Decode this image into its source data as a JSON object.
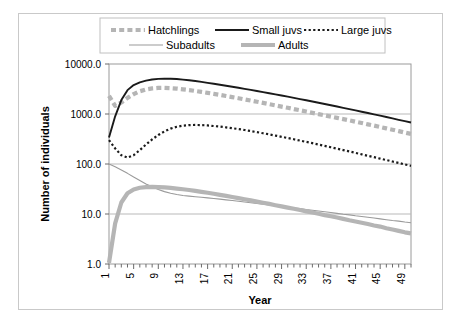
{
  "chart_data": {
    "type": "line",
    "title": "",
    "xlabel": "Year",
    "ylabel": "Number of individuals",
    "yscale": "log",
    "ylim": [
      1.0,
      10000.0
    ],
    "ytick_labels": [
      "1.0",
      "10.0",
      "100.0",
      "1000.0",
      "10000.0"
    ],
    "ytick_values": [
      1,
      10,
      100,
      1000,
      10000
    ],
    "xlim": [
      1,
      50
    ],
    "xtick_labels": [
      "1",
      "5",
      "9",
      "13",
      "17",
      "21",
      "25",
      "29",
      "33",
      "37",
      "41",
      "45",
      "49"
    ],
    "xtick_values": [
      1,
      5,
      9,
      13,
      17,
      21,
      25,
      29,
      33,
      37,
      41,
      45,
      49
    ],
    "grid": true,
    "legend_position": "top",
    "x": [
      1,
      2,
      3,
      4,
      5,
      6,
      7,
      8,
      9,
      10,
      11,
      12,
      13,
      14,
      15,
      16,
      17,
      18,
      19,
      20,
      21,
      22,
      23,
      24,
      25,
      26,
      27,
      28,
      29,
      30,
      31,
      32,
      33,
      34,
      35,
      36,
      37,
      38,
      39,
      40,
      41,
      42,
      43,
      44,
      45,
      46,
      47,
      48,
      49,
      50
    ],
    "series": [
      {
        "name": "Hatchlings",
        "color": "#b5b5b5",
        "style": "dashed",
        "width": 4.2,
        "values": [
          2300,
          1450,
          1700,
          2100,
          2500,
          2850,
          3100,
          3250,
          3320,
          3330,
          3290,
          3220,
          3120,
          3010,
          2890,
          2770,
          2650,
          2530,
          2410,
          2290,
          2180,
          2070,
          1960,
          1860,
          1760,
          1665,
          1575,
          1490,
          1405,
          1330,
          1255,
          1185,
          1120,
          1055,
          995,
          940,
          885,
          835,
          790,
          745,
          700,
          660,
          620,
          585,
          550,
          515,
          485,
          455,
          425,
          400
        ]
      },
      {
        "name": "Small juvs",
        "color": "#1a1a1a",
        "style": "solid",
        "width": 1.9,
        "values": [
          340,
          900,
          1900,
          3000,
          3800,
          4300,
          4650,
          4900,
          5050,
          5100,
          5080,
          5000,
          4880,
          4730,
          4560,
          4380,
          4200,
          4020,
          3840,
          3670,
          3500,
          3340,
          3180,
          3030,
          2880,
          2740,
          2600,
          2470,
          2340,
          2220,
          2100,
          1990,
          1880,
          1780,
          1680,
          1585,
          1495,
          1410,
          1330,
          1250,
          1180,
          1110,
          1045,
          985,
          925,
          870,
          815,
          765,
          720,
          675
        ]
      },
      {
        "name": "Large juvs",
        "color": "#1a1a1a",
        "style": "dotted",
        "width": 2.2,
        "values": [
          300,
          205,
          150,
          135,
          150,
          190,
          245,
          310,
          380,
          450,
          510,
          555,
          585,
          600,
          605,
          600,
          590,
          575,
          560,
          540,
          520,
          500,
          478,
          456,
          434,
          412,
          391,
          370,
          350,
          331,
          312,
          294,
          277,
          261,
          245,
          230,
          216,
          203,
          190,
          178,
          167,
          156,
          146,
          137,
          128,
          120,
          112,
          105,
          98,
          92
        ]
      },
      {
        "name": "Subadults",
        "color": "#9a9a9a",
        "style": "solid",
        "width": 1.1,
        "values": [
          100,
          88,
          76,
          65,
          55,
          47,
          40,
          35,
          31,
          28,
          26,
          24.5,
          23.5,
          22.8,
          22.2,
          21.6,
          21.0,
          20.4,
          19.8,
          19.2,
          18.6,
          18.0,
          17.4,
          16.8,
          16.3,
          15.7,
          15.2,
          14.7,
          14.2,
          13.7,
          13.2,
          12.8,
          12.3,
          11.9,
          11.5,
          11.1,
          10.7,
          10.3,
          9.9,
          9.6,
          9.2,
          8.9,
          8.6,
          8.3,
          8.0,
          7.7,
          7.4,
          7.2,
          6.9,
          6.7
        ]
      },
      {
        "name": "Adults",
        "color": "#b5b5b5",
        "style": "solid",
        "width": 4.2,
        "values": [
          1.05,
          6.5,
          17,
          26,
          31,
          33.5,
          34.5,
          34.8,
          34.5,
          34.0,
          33.2,
          32.3,
          31.3,
          30.2,
          29.0,
          27.8,
          26.6,
          25.4,
          24.2,
          23.0,
          21.9,
          20.8,
          19.7,
          18.7,
          17.7,
          16.8,
          15.9,
          15.0,
          14.2,
          13.4,
          12.7,
          12.0,
          11.3,
          10.7,
          10.1,
          9.5,
          9.0,
          8.5,
          8.0,
          7.5,
          7.1,
          6.7,
          6.3,
          5.9,
          5.6,
          5.2,
          4.9,
          4.6,
          4.3,
          4.1
        ]
      }
    ]
  },
  "legend": {
    "items": [
      {
        "label": "Hatchlings"
      },
      {
        "label": "Small juvs"
      },
      {
        "label": "Large juvs"
      },
      {
        "label": "Subadults"
      },
      {
        "label": "Adults"
      }
    ]
  }
}
